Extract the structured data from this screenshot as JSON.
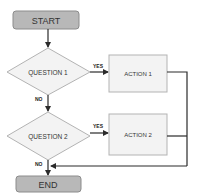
{
  "flowchart": {
    "start": {
      "label": "START"
    },
    "end": {
      "label": "END"
    },
    "questions": [
      {
        "label": "QUESTION 1",
        "yes_label": "YES",
        "no_label": "NO"
      },
      {
        "label": "QUESTION 2",
        "yes_label": "YES",
        "no_label": "NO"
      }
    ],
    "actions": [
      {
        "label": "ACTION 1"
      },
      {
        "label": "ACTION 2"
      }
    ]
  },
  "colors": {
    "terminal_fill": "#b8b8b8",
    "terminal_stroke": "#8c8c8c",
    "shape_fill": "#f3f3f3",
    "shape_stroke": "#b3b3b3",
    "connector": "#2b2b2b"
  }
}
